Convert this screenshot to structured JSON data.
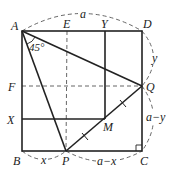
{
  "diagram": {
    "type": "geometry",
    "colors": {
      "stroke": "#222222",
      "background": "#ffffff"
    },
    "points": {
      "A": {
        "label": "A",
        "x": 22,
        "y": 31
      },
      "D": {
        "label": "D",
        "x": 142,
        "y": 31
      },
      "B": {
        "label": "B",
        "x": 22,
        "y": 151
      },
      "C": {
        "label": "C",
        "x": 142,
        "y": 151
      },
      "E": {
        "label": "E",
        "x": 67,
        "y": 31
      },
      "Y": {
        "label": "Y",
        "x": 105,
        "y": 31
      },
      "F": {
        "label": "F",
        "x": 22,
        "y": 86
      },
      "Q": {
        "label": "Q",
        "x": 142,
        "y": 86
      },
      "X": {
        "label": "X",
        "x": 22,
        "y": 119
      },
      "M": {
        "label": "M",
        "x": 105,
        "y": 119
      },
      "P": {
        "label": "P",
        "x": 66,
        "y": 151
      }
    },
    "angle_label": "45°",
    "measure_labels": {
      "top": "a",
      "right_upper": "y",
      "right_lower": "a−y",
      "bottom_left": "x",
      "bottom_right": "a−x"
    }
  }
}
